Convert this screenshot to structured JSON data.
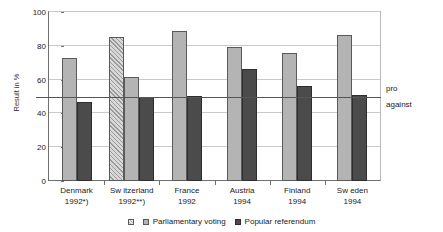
{
  "chart_data": {
    "type": "bar",
    "title": "",
    "subtitle": "",
    "xlabel": "",
    "ylabel": "Result in %",
    "ylim": [
      0,
      100
    ],
    "yticks": [
      0,
      20,
      40,
      60,
      80,
      100
    ],
    "ytick_labels": [
      "0",
      "20",
      "40",
      "60",
      "80",
      "100"
    ],
    "grid": true,
    "legend_position": "bottom",
    "categories": [
      "Denmark",
      "Sw itzerland",
      "France",
      "Austria",
      "Finland",
      "Sw eden"
    ],
    "category_sublabels": [
      "1992*)",
      "1992**)",
      "1992",
      "1994",
      "1994",
      "1994"
    ],
    "series": [
      {
        "name": "Parliamentary voting (special)",
        "legend_key": "special",
        "values": [
          null,
          85,
          null,
          null,
          null,
          null
        ]
      },
      {
        "name": "Parliamentary voting",
        "legend_key": "parliament",
        "values": [
          72.5,
          61.5,
          88.5,
          79.5,
          75.5,
          86.5
        ]
      },
      {
        "name": "Popular referendum",
        "legend_key": "referendum",
        "values": [
          47,
          50,
          50.5,
          66,
          56,
          51
        ]
      }
    ],
    "annotations": [
      {
        "name": "threshold",
        "value": 50,
        "labels": [
          "pro",
          "against"
        ]
      }
    ],
    "legend": [
      {
        "key": "special",
        "label": ""
      },
      {
        "key": "parliament",
        "label": "Parliamentary voting"
      },
      {
        "key": "referendum",
        "label": "Popular referendum"
      }
    ],
    "colors": {
      "parliament": "#b4b4b4",
      "referendum": "#4b4b4b",
      "special": "#d8d8d8",
      "threshold": "#555555",
      "grid": "#c9c9c9",
      "axis": "#6f6f6f"
    }
  },
  "threshold_labels": {
    "pro": "pro",
    "against": "against"
  }
}
